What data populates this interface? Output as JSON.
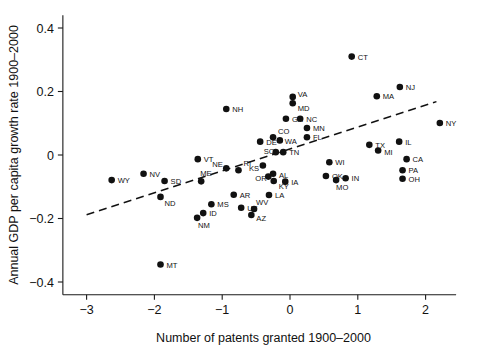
{
  "chart_data": {
    "type": "scatter",
    "title": "",
    "xlabel": "Number of patents granted 1900–2000",
    "ylabel": "Annual GDP per capita growth rate 1900–2000",
    "xlim": [
      -3.35,
      2.45
    ],
    "ylim": [
      -0.44,
      0.44
    ],
    "xticks": [
      -3,
      -2,
      -1,
      0,
      1,
      2
    ],
    "xticklabels": [
      "−3",
      "−2",
      "−1",
      "0",
      "1",
      "2"
    ],
    "yticks": [
      -0.4,
      -0.2,
      0,
      0.2,
      0.4
    ],
    "yticklabels": [
      "−0.4",
      "−0.2",
      "0",
      "0.2",
      "0.4"
    ],
    "grid": false,
    "legend": null,
    "marker": {
      "shape": "circle",
      "color": "#111111",
      "size": 3.3
    },
    "trendline": {
      "style": "dashed",
      "color": "#111111",
      "x_start": -3.0,
      "y_start": -0.188,
      "x_end": 2.16,
      "y_end": 0.168
    },
    "point_label_field": "label",
    "points": [
      {
        "label": "WY",
        "x": -2.63,
        "y": -0.079,
        "lx": 6,
        "ly": 3
      },
      {
        "label": "NV",
        "x": -2.16,
        "y": -0.059,
        "lx": 6,
        "ly": 3
      },
      {
        "label": "SD",
        "x": -1.85,
        "y": -0.082,
        "lx": 6,
        "ly": 3
      },
      {
        "label": "ND",
        "x": -1.91,
        "y": -0.132,
        "lx": 4,
        "ly": 9
      },
      {
        "label": "MT",
        "x": -1.91,
        "y": -0.345,
        "lx": 6,
        "ly": 3
      },
      {
        "label": "NM",
        "x": -1.37,
        "y": -0.198,
        "lx": 1,
        "ly": 10
      },
      {
        "label": "ID",
        "x": -1.28,
        "y": -0.183,
        "lx": 6,
        "ly": 3
      },
      {
        "label": "MS",
        "x": -1.16,
        "y": -0.155,
        "lx": 6,
        "ly": 3
      },
      {
        "label": "ME",
        "x": -1.31,
        "y": -0.083,
        "lx": -1,
        "ly": -5
      },
      {
        "label": "VT",
        "x": -1.36,
        "y": -0.013,
        "lx": 6,
        "ly": 3
      },
      {
        "label": "NE",
        "x": -0.94,
        "y": -0.042,
        "lx": -14,
        "ly": -1
      },
      {
        "label": "AR",
        "x": -0.83,
        "y": -0.125,
        "lx": 6,
        "ly": 3
      },
      {
        "label": "UT",
        "x": -0.72,
        "y": -0.166,
        "lx": 6,
        "ly": 3
      },
      {
        "label": "LA",
        "x": -0.31,
        "y": -0.126,
        "lx": 6,
        "ly": 3
      },
      {
        "label": "AZ",
        "x": -0.57,
        "y": -0.189,
        "lx": 5,
        "ly": 6
      },
      {
        "label": "WV",
        "x": -0.53,
        "y": -0.17,
        "lx": 2,
        "ly": -4
      },
      {
        "label": "RI",
        "x": -0.76,
        "y": -0.048,
        "lx": 5,
        "ly": -4
      },
      {
        "label": "NH",
        "x": -0.94,
        "y": 0.145,
        "lx": 6,
        "ly": 3
      },
      {
        "label": "KS",
        "x": -0.4,
        "y": -0.033,
        "lx": -14,
        "ly": 6
      },
      {
        "label": "OR",
        "x": -0.32,
        "y": -0.068,
        "lx": -13,
        "ly": 4
      },
      {
        "label": "AL",
        "x": -0.25,
        "y": -0.059,
        "lx": 6,
        "ly": 4
      },
      {
        "label": "KY",
        "x": -0.24,
        "y": -0.082,
        "lx": 5,
        "ly": 8
      },
      {
        "label": "IA",
        "x": -0.07,
        "y": -0.084,
        "lx": 6,
        "ly": 3
      },
      {
        "label": "DE",
        "x": -0.44,
        "y": 0.042,
        "lx": 6,
        "ly": 3
      },
      {
        "label": "SC",
        "x": -0.21,
        "y": 0.009,
        "lx": -12,
        "ly": 2
      },
      {
        "label": "CO",
        "x": -0.25,
        "y": 0.056,
        "lx": 5,
        "ly": -3
      },
      {
        "label": "WA",
        "x": -0.15,
        "y": 0.046,
        "lx": 5,
        "ly": 4
      },
      {
        "label": "TN",
        "x": -0.1,
        "y": 0.009,
        "lx": 6,
        "ly": 3
      },
      {
        "label": "GA",
        "x": -0.06,
        "y": 0.114,
        "lx": 6,
        "ly": 3
      },
      {
        "label": "VA",
        "x": 0.04,
        "y": 0.183,
        "lx": 5,
        "ly": 0
      },
      {
        "label": "MD",
        "x": 0.04,
        "y": 0.163,
        "lx": 5,
        "ly": 8
      },
      {
        "label": "NC",
        "x": 0.15,
        "y": 0.114,
        "lx": 6,
        "ly": 3
      },
      {
        "label": "MN",
        "x": 0.25,
        "y": 0.085,
        "lx": 6,
        "ly": 3
      },
      {
        "label": "FL",
        "x": 0.25,
        "y": 0.056,
        "lx": 6,
        "ly": 3
      },
      {
        "label": "OK",
        "x": 0.53,
        "y": -0.066,
        "lx": 6,
        "ly": 3
      },
      {
        "label": "MO",
        "x": 0.68,
        "y": -0.079,
        "lx": 0,
        "ly": 10
      },
      {
        "label": "IN",
        "x": 0.82,
        "y": -0.073,
        "lx": 6,
        "ly": 3
      },
      {
        "label": "WI",
        "x": 0.58,
        "y": -0.023,
        "lx": 6,
        "ly": 3
      },
      {
        "label": "CT",
        "x": 0.91,
        "y": 0.31,
        "lx": 6,
        "ly": 3
      },
      {
        "label": "MA",
        "x": 1.28,
        "y": 0.185,
        "lx": 6,
        "ly": 3
      },
      {
        "label": "NJ",
        "x": 1.62,
        "y": 0.214,
        "lx": 6,
        "ly": 3
      },
      {
        "label": "TX",
        "x": 1.17,
        "y": 0.032,
        "lx": 6,
        "ly": 3
      },
      {
        "label": "MI",
        "x": 1.3,
        "y": 0.014,
        "lx": 6,
        "ly": 4
      },
      {
        "label": "IL",
        "x": 1.61,
        "y": 0.042,
        "lx": 6,
        "ly": 3
      },
      {
        "label": "CA",
        "x": 1.72,
        "y": -0.013,
        "lx": 6,
        "ly": 3
      },
      {
        "label": "PA",
        "x": 1.66,
        "y": -0.048,
        "lx": 6,
        "ly": 3
      },
      {
        "label": "OH",
        "x": 1.66,
        "y": -0.075,
        "lx": 6,
        "ly": 3
      },
      {
        "label": "NY",
        "x": 2.21,
        "y": 0.101,
        "lx": 6,
        "ly": 3
      }
    ]
  }
}
